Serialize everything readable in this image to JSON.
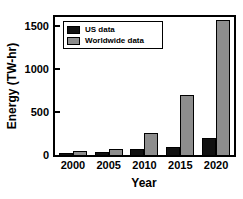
{
  "chart_data": {
    "type": "bar",
    "title": "",
    "xlabel": "Year",
    "ylabel": "Energy (TW-hr)",
    "categories": [
      "2000",
      "2005",
      "2010",
      "2015",
      "2020"
    ],
    "series": [
      {
        "name": "US data",
        "color": "#111111",
        "values": [
          20,
          30,
          70,
          90,
          200
        ]
      },
      {
        "name": "Worldwide data",
        "color": "#8d8d8d",
        "values": [
          50,
          75,
          250,
          700,
          1560
        ]
      }
    ],
    "ylim": [
      0,
      1600
    ],
    "yticks": [
      0,
      500,
      1000,
      1500
    ],
    "legend_position": "top-left",
    "grid": false,
    "frame": "box",
    "bar_edge_color": "#000000",
    "text_color": "#000000",
    "background_color": "#ffffff"
  }
}
